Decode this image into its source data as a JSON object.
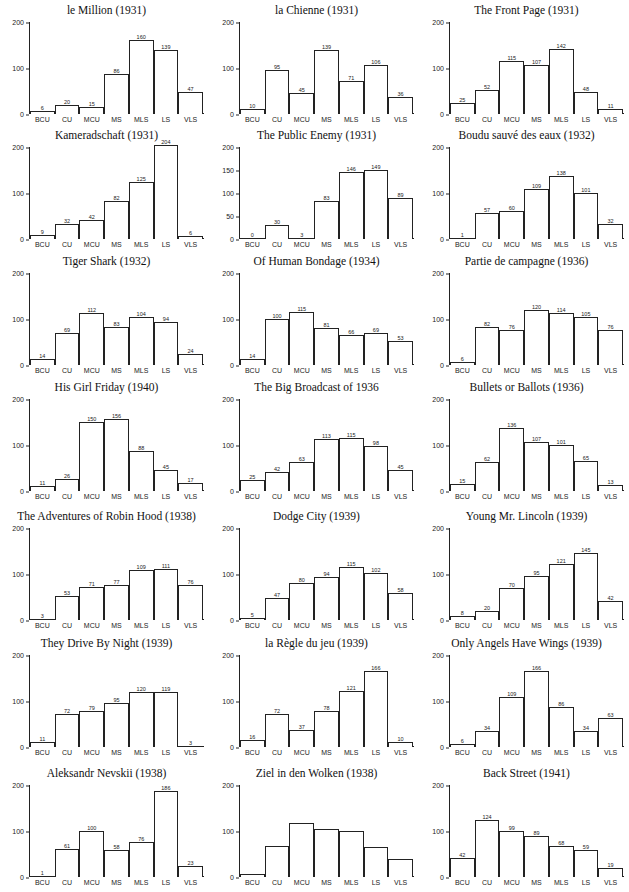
{
  "page_header": "",
  "chart_data": [
    {
      "type": "bar",
      "title": "le Million (1931)",
      "categories": [
        "BCU",
        "CU",
        "MCU",
        "MS",
        "MLS",
        "LS",
        "VLS"
      ],
      "values": [
        6,
        20,
        15,
        86,
        160,
        139,
        47
      ],
      "show_labels": true,
      "yticks": [
        0,
        100,
        200
      ],
      "ylim": [
        0,
        200
      ],
      "xlabel": "",
      "ylabel": ""
    },
    {
      "type": "bar",
      "title": "la Chienne (1931)",
      "categories": [
        "BCU",
        "CU",
        "MCU",
        "MS",
        "MLS",
        "LS",
        "VLS"
      ],
      "values": [
        10,
        95,
        45,
        139,
        71,
        106,
        36
      ],
      "show_labels": true,
      "yticks": [
        0,
        100,
        200
      ],
      "ylim": [
        0,
        200
      ],
      "xlabel": "",
      "ylabel": ""
    },
    {
      "type": "bar",
      "title": "The Front Page (1931)",
      "categories": [
        "BCU",
        "CU",
        "MCU",
        "MS",
        "MLS",
        "LS",
        "VLS"
      ],
      "values": [
        25,
        52,
        115,
        107,
        142,
        48,
        11
      ],
      "show_labels": true,
      "yticks": [
        0,
        100,
        200
      ],
      "ylim": [
        0,
        200
      ],
      "xlabel": "",
      "ylabel": ""
    },
    {
      "type": "bar",
      "title": "Kameradschaft (1931)",
      "categories": [
        "BCU",
        "CU",
        "MCU",
        "MS",
        "MLS",
        "LS",
        "VLS"
      ],
      "values": [
        9,
        32,
        42,
        82,
        125,
        204,
        6
      ],
      "show_labels": true,
      "yticks": [
        0,
        100,
        200
      ],
      "ylim": [
        0,
        200
      ],
      "xlabel": "",
      "ylabel": ""
    },
    {
      "type": "bar",
      "title": "The Public Enemy (1931)",
      "categories": [
        "BCU",
        "CU",
        "MCU",
        "MS",
        "MLS",
        "LS",
        "VLS"
      ],
      "values": [
        0,
        30,
        3,
        83,
        146,
        149,
        89
      ],
      "show_labels": true,
      "yticks": [
        0,
        50,
        100,
        150,
        200
      ],
      "ylim": [
        0,
        200
      ],
      "xlabel": "",
      "ylabel": ""
    },
    {
      "type": "bar",
      "title": "Boudu sauvé des eaux (1932)",
      "categories": [
        "BCU",
        "CU",
        "MCU",
        "MS",
        "MLS",
        "LS",
        "VLS"
      ],
      "values": [
        1,
        57,
        60,
        109,
        138,
        101,
        32
      ],
      "show_labels": true,
      "yticks": [
        0,
        100,
        200
      ],
      "ylim": [
        0,
        200
      ],
      "xlabel": "",
      "ylabel": ""
    },
    {
      "type": "bar",
      "title": "Tiger Shark (1932)",
      "categories": [
        "BCU",
        "CU",
        "MCU",
        "MS",
        "MLS",
        "LS",
        "VLS"
      ],
      "values": [
        14,
        69,
        112,
        83,
        104,
        94,
        24
      ],
      "show_labels": true,
      "yticks": [
        0,
        100,
        200
      ],
      "ylim": [
        0,
        200
      ],
      "xlabel": "",
      "ylabel": ""
    },
    {
      "type": "bar",
      "title": "Of Human Bondage (1934)",
      "categories": [
        "BCU",
        "CU",
        "MCU",
        "MS",
        "MLS",
        "LS",
        "VLS"
      ],
      "values": [
        14,
        100,
        115,
        81,
        66,
        69,
        53
      ],
      "show_labels": true,
      "yticks": [
        0,
        100,
        200
      ],
      "ylim": [
        0,
        200
      ],
      "xlabel": "",
      "ylabel": ""
    },
    {
      "type": "bar",
      "title": "Partie de campagne (1936)",
      "categories": [
        "BCU",
        "CU",
        "MCU",
        "MS",
        "MLS",
        "LS",
        "VLS"
      ],
      "values": [
        6,
        82,
        76,
        120,
        114,
        105,
        76
      ],
      "show_labels": true,
      "yticks": [
        0,
        100,
        200
      ],
      "ylim": [
        0,
        200
      ],
      "xlabel": "",
      "ylabel": ""
    },
    {
      "type": "bar",
      "title": "His Girl Friday (1940)",
      "categories": [
        "BCU",
        "CU",
        "MCU",
        "MS",
        "MLS",
        "LS",
        "VLS"
      ],
      "values": [
        11,
        26,
        150,
        156,
        88,
        45,
        17
      ],
      "show_labels": true,
      "yticks": [
        0,
        100,
        200
      ],
      "ylim": [
        0,
        200
      ],
      "xlabel": "",
      "ylabel": ""
    },
    {
      "type": "bar",
      "title": "The Big Broadcast of 1936",
      "categories": [
        "BCU",
        "CU",
        "MCU",
        "MS",
        "MLS",
        "LS",
        "VLS"
      ],
      "values": [
        25,
        42,
        63,
        113,
        115,
        98,
        45
      ],
      "show_labels": true,
      "yticks": [
        0,
        100,
        200
      ],
      "ylim": [
        0,
        200
      ],
      "xlabel": "",
      "ylabel": ""
    },
    {
      "type": "bar",
      "title": "Bullets or Ballots (1936)",
      "categories": [
        "BCU",
        "CU",
        "MCU",
        "MS",
        "MLS",
        "LS",
        "VLS"
      ],
      "values": [
        15,
        62,
        136,
        107,
        101,
        65,
        13
      ],
      "show_labels": true,
      "yticks": [
        0,
        100,
        200
      ],
      "ylim": [
        0,
        200
      ],
      "xlabel": "",
      "ylabel": ""
    },
    {
      "type": "bar",
      "title": "The Adventures of Robin Hood (1938)",
      "categories": [
        "BCU",
        "CU",
        "MCU",
        "MS",
        "MLS",
        "LS",
        "VLS"
      ],
      "values": [
        3,
        53,
        71,
        77,
        109,
        111,
        76
      ],
      "show_labels": true,
      "yticks": [
        0,
        100,
        200
      ],
      "ylim": [
        0,
        200
      ],
      "xlabel": "",
      "ylabel": ""
    },
    {
      "type": "bar",
      "title": "Dodge City (1939)",
      "categories": [
        "BCU",
        "CU",
        "MCU",
        "MS",
        "MLS",
        "LS",
        "VLS"
      ],
      "values": [
        5,
        47,
        80,
        94,
        115,
        102,
        58
      ],
      "show_labels": true,
      "yticks": [
        0,
        100,
        200
      ],
      "ylim": [
        0,
        200
      ],
      "xlabel": "",
      "ylabel": ""
    },
    {
      "type": "bar",
      "title": "Young Mr. Lincoln (1939)",
      "categories": [
        "BCU",
        "CU",
        "MCU",
        "MS",
        "MLS",
        "LS",
        "VLS"
      ],
      "values": [
        8,
        20,
        70,
        95,
        121,
        145,
        42
      ],
      "show_labels": true,
      "yticks": [
        0,
        100,
        200
      ],
      "ylim": [
        0,
        200
      ],
      "xlabel": "",
      "ylabel": ""
    },
    {
      "type": "bar",
      "title": "They Drive By Night (1939)",
      "categories": [
        "BCU",
        "CU",
        "MCU",
        "MS",
        "MLS",
        "LS",
        "VLS"
      ],
      "values": [
        11,
        72,
        79,
        95,
        120,
        119,
        3
      ],
      "show_labels": true,
      "yticks": [
        0,
        100,
        200
      ],
      "ylim": [
        0,
        200
      ],
      "xlabel": "",
      "ylabel": ""
    },
    {
      "type": "bar",
      "title": "la Règle du jeu (1939)",
      "categories": [
        "BCU",
        "CU",
        "MCU",
        "MS",
        "MLS",
        "LS",
        "VLS"
      ],
      "values": [
        16,
        72,
        37,
        78,
        121,
        166,
        10
      ],
      "show_labels": true,
      "yticks": [
        0,
        100,
        200
      ],
      "ylim": [
        0,
        200
      ],
      "xlabel": "",
      "ylabel": ""
    },
    {
      "type": "bar",
      "title": "Only Angels Have Wings (1939)",
      "categories": [
        "BCU",
        "CU",
        "MCU",
        "MS",
        "MLS",
        "LS",
        "VLS"
      ],
      "values": [
        6,
        34,
        109,
        166,
        86,
        34,
        63
      ],
      "show_labels": true,
      "yticks": [
        0,
        100,
        200
      ],
      "ylim": [
        0,
        200
      ],
      "xlabel": "",
      "ylabel": ""
    },
    {
      "type": "bar",
      "title": "Aleksandr Nevskii (1938)",
      "categories": [
        "BCU",
        "CU",
        "MCU",
        "MS",
        "MLS",
        "LS",
        "VLS"
      ],
      "values": [
        1,
        61,
        100,
        58,
        76,
        186,
        23
      ],
      "show_labels": true,
      "yticks": [
        0,
        100,
        200
      ],
      "ylim": [
        0,
        200
      ],
      "xlabel": "",
      "ylabel": ""
    },
    {
      "type": "bar",
      "title": "Ziel in den Wolken (1938)",
      "categories": [
        "BCU",
        "CU",
        "MCU",
        "MS",
        "MLS",
        "LS",
        "VLS"
      ],
      "values": [
        6,
        67,
        118,
        104,
        99,
        66,
        40
      ],
      "show_labels": false,
      "yticks": [
        0,
        100,
        200
      ],
      "ylim": [
        0,
        200
      ],
      "xlabel": "",
      "ylabel": ""
    },
    {
      "type": "bar",
      "title": "Back Street (1941)",
      "categories": [
        "BCU",
        "CU",
        "MCU",
        "MS",
        "MLS",
        "LS",
        "VLS"
      ],
      "values": [
        42,
        124,
        99,
        89,
        68,
        59,
        19
      ],
      "show_labels": true,
      "yticks": [
        0,
        100,
        200
      ],
      "ylim": [
        0,
        200
      ],
      "xlabel": "",
      "ylabel": ""
    }
  ]
}
